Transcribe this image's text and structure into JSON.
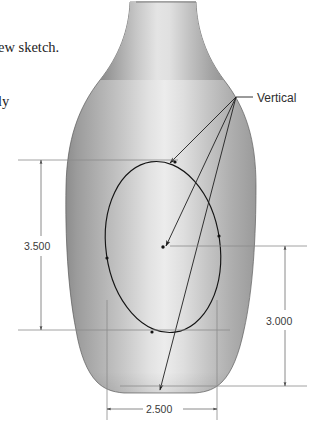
{
  "document": {
    "title": "Vase part with vertical relation sketch",
    "background_color": "#ffffff"
  },
  "text_fragments": [
    {
      "id": "frag_top",
      "text": "ew sketch.",
      "x": 0,
      "y": 52
    },
    {
      "id": "frag_second",
      "text": "ly",
      "x": 0,
      "y": 106
    }
  ],
  "annotations": [
    {
      "id": "vertical_label",
      "text": "Vertical",
      "x": 257,
      "y": 102
    }
  ],
  "dimensions": [
    {
      "id": "dim_height_left",
      "value": "3.500",
      "orientation": "vertical",
      "text_x": 24,
      "text_y": 246
    },
    {
      "id": "dim_height_right",
      "value": "3.000",
      "orientation": "vertical",
      "text_x": 286,
      "text_y": 321
    },
    {
      "id": "dim_width_bottom",
      "value": "2.500",
      "orientation": "horizontal",
      "text_x": 162,
      "text_y": 413
    }
  ],
  "model": {
    "name": "vase",
    "shading": {
      "highlight_color": "#e9e9e9",
      "mid_color": "#b8b8b8",
      "shadow_color": "#8f8f8f",
      "dark_edge_color": "#7a7a7a",
      "outline_color": "#5b5b5b"
    },
    "sketch": {
      "shape": "ellipse",
      "stroke_color": "#141414"
    }
  },
  "colors": {
    "dimension_line": "#6d6d6d",
    "extension_line": "#8a8a8a",
    "leader_line": "#1f1f1f",
    "text": "#2b2b2b"
  }
}
